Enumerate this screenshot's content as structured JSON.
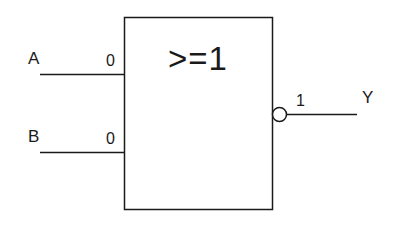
{
  "diagram": {
    "type": "logic-gate",
    "gate": {
      "symbol": ">=1",
      "kind": "NOR",
      "output_inverted": true
    },
    "inputs": [
      {
        "name": "A",
        "value": "0"
      },
      {
        "name": "B",
        "value": "0"
      }
    ],
    "output": {
      "name": "Y",
      "value": "1"
    },
    "colors": {
      "line": "#1a1a1a",
      "background": "#ffffff"
    }
  }
}
